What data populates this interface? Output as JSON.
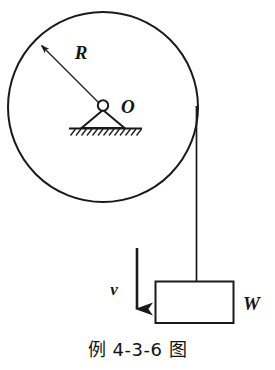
{
  "figure": {
    "caption": "例 4-3-6 图",
    "background_color": "#ffffff",
    "ink_color": "#1a1a1a"
  },
  "labels": {
    "radius": "R",
    "center": "O",
    "velocity": "v",
    "weight": "W"
  },
  "diagram_data": {
    "type": "physics-schematic",
    "description": "Pulley of radius R pivoted at O on a hatched fixed support; a rope over the pulley rim hangs vertically on the right and carries a rectangular block of weight W descending with velocity v.",
    "pulley": {
      "center_x": 103,
      "center_y": 107,
      "radius": 95,
      "stroke_width": 2.0
    },
    "radius_arrow": {
      "from_x": 103,
      "from_y": 107,
      "to_x": 38,
      "to_y": 42,
      "label": "R",
      "label_x": 81,
      "label_y": 57
    },
    "pivot": {
      "hub_x": 103,
      "hub_y": 107,
      "hub_radius": 5,
      "triangle_half_width": 22,
      "ground_y": 128,
      "ground_x1": 70,
      "ground_x2": 142,
      "hatch_count": 13,
      "label": "O",
      "label_x": 120,
      "label_y": 112
    },
    "rope": {
      "x": 196,
      "y_top": 107,
      "y_bottom": 281,
      "stroke_width": 1.6
    },
    "block": {
      "x": 155,
      "y": 281,
      "width": 78,
      "height": 42,
      "label": "W",
      "label_x": 243,
      "label_y": 309
    },
    "velocity_arrow": {
      "x": 137,
      "y_top": 248,
      "y_bottom": 326,
      "direction": "down",
      "label": "v",
      "label_x": 114,
      "label_y": 294
    }
  }
}
